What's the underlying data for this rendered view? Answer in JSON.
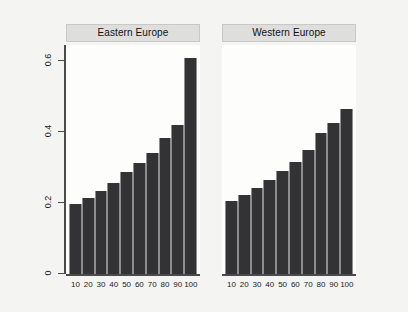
{
  "chart_data": {
    "type": "bar",
    "title": "",
    "xlabel": "",
    "ylabel": "mean of Dummy_exp_mean",
    "ylim": [
      0,
      0.65
    ],
    "yticks": [
      0,
      0.2,
      0.4,
      0.6
    ],
    "ytick_labels": [
      "0",
      "0.2",
      "0.4",
      "0.6"
    ],
    "grid": false,
    "legend": "none",
    "categories": [
      "10",
      "20",
      "30",
      "40",
      "50",
      "60",
      "70",
      "80",
      "90",
      "100"
    ],
    "panels": [
      {
        "label": "Eastern Europe",
        "values": [
          0.2,
          0.217,
          0.237,
          0.259,
          0.29,
          0.316,
          0.344,
          0.386,
          0.423,
          0.614
        ]
      },
      {
        "label": "Western Europe",
        "values": [
          0.206,
          0.223,
          0.245,
          0.268,
          0.293,
          0.318,
          0.352,
          0.4,
          0.428,
          0.468
        ]
      }
    ],
    "colors": {
      "bar_fill": "#333335",
      "bar_edge": "#8e8e90",
      "panel_background": "#fdfdfc",
      "strip_background": "#dededc",
      "figure_background": "#f4f4f2",
      "axis": "#4a4a4a"
    }
  }
}
